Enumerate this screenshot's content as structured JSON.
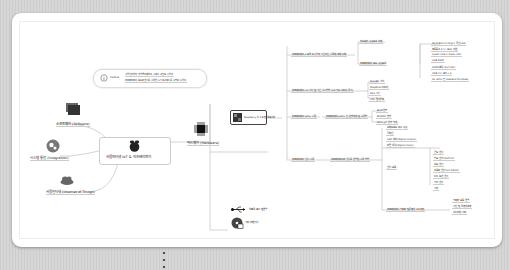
{
  "mindmap": {
    "central": {
      "label": "사물인터넷 IoT & 라즈베리파이"
    },
    "callout": {
      "label": "Callout",
      "lines": [
        "사물인터넷의 개념을 이해하고 실제로 구현할 수 있다.",
        "라즈베리파이 보드와 센서를 활용한 IoT 프로젝트를 수행할 수 있다."
      ]
    },
    "left_branches": [
      {
        "label": "소프트웨어 (Software)",
        "icon": "folder-stack-icon"
      },
      {
        "label": "시스템 통합 (Integration)",
        "icon": "gears-icon"
      },
      {
        "label": "사물인터넷 (Internet of Things)",
        "icon": "cloud-icon"
      }
    ],
    "hardware": {
      "label": "하드웨어 (Hardware)",
      "child": {
        "label": "Raspberry Pi 3 B 및 액세서리"
      },
      "topics": [
        {
          "label": "라즈베리파이 3 모델 B 사양과 기본적인 활용에 대해 이해",
          "sub": [
            {
              "label": "하드웨어 구성요소 이해"
            },
            {
              "label": "라즈베리파이 보드 구성 요소",
              "leaves": [
                "Wi-Fi 802.11 b/g/n 무선 LAN",
                "블루투스 4.1 / BLE 지원",
                "Quad Core 1.2GHz CPU",
                "1GB RAM",
                "HDMI 출력 (Full HD)",
                "USB 2.0 포트 x 4",
                "40 GPIO 핀 (General Purpose)"
              ]
            }
          ]
        },
        {
          "label": "라즈베리파이 OS 설치 및 기본 설정 방법 (SD 카드 이미지 굽기)",
          "leaves": [
            "NOOBS 설치",
            "Raspbian 이미지",
            "SSH 설정",
            "VNC 원격접속"
          ]
        },
        {
          "label": "라즈베리파이 GPIO 활용",
          "sub": [
            {
              "label": "라즈베리파이 GPIO 핀 번호 체계 및 활용법",
              "leaves": [
                "BCM 번호",
                "BOARD 번호",
                "WiringPi 번호 체계"
              ]
            }
          ]
        },
        {
          "label": "라즈베리파이 센서 활용",
          "sub": [
            {
              "label": "라즈베리파이와 센서를 연결 및 활용 방법",
              "leaves": [
                "브레드보드 회로 구성",
                "점퍼선",
                "LED 제어 (digital output)",
                "버튼 입력 (digital input)"
              ],
              "groups": [
                {
                  "label": "센서 모듈",
                  "leaves": [
                    "온도 센서",
                    "습도 센서 (DHT11)",
                    "조도 센서",
                    "초음파 센서 (HC-SR04)",
                    "PIR 모션 센서",
                    "가스 센서",
                    "기타"
                  ]
                },
                {
                  "label": "라즈베리파이 카메라 및 동영상 스트리밍",
                  "leaves": [
                    "카메라 모듈 연결",
                    "사진 및 동영상 촬영",
                    "스트리밍 서버"
                  ]
                }
              ]
            }
          ]
        }
      ]
    },
    "bottom_branches": [
      {
        "label": "입출력 포트 및 연결",
        "icon": "usb-icon"
      },
      {
        "label": "기타 주변기기",
        "icon": "disc-icon"
      }
    ]
  },
  "pager": {
    "dots": 3
  }
}
